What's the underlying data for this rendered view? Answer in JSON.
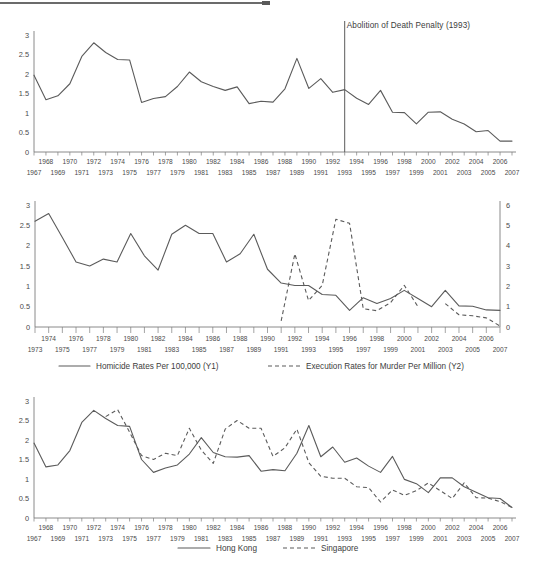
{
  "page": {
    "top_rule": "horizontal-rule",
    "background_color": "#ffffff",
    "line_color": "#5b5b5b",
    "text_color": "#3f3f3f"
  },
  "chart_data": [
    {
      "id": "chart1",
      "type": "line",
      "title": "",
      "xlabel": "",
      "ylabel": "",
      "ylim": [
        0,
        3
      ],
      "yticks": [
        "0",
        "0.5",
        "1",
        "1.5",
        "2",
        "2.5",
        "3"
      ],
      "grid": false,
      "legend": "none",
      "annotations": [
        {
          "text": "Abolition of Death Penalty (1993)",
          "x_year": 1993,
          "type": "vertical-line-label"
        }
      ],
      "categories": [
        1967,
        1968,
        1969,
        1970,
        1971,
        1972,
        1973,
        1974,
        1975,
        1976,
        1977,
        1978,
        1979,
        1980,
        1981,
        1982,
        1983,
        1984,
        1985,
        1986,
        1987,
        1988,
        1989,
        1990,
        1991,
        1992,
        1993,
        1994,
        1995,
        1996,
        1997,
        1998,
        1999,
        2000,
        2001,
        2002,
        2003,
        2004,
        2005,
        2006,
        2007
      ],
      "series": [
        {
          "name": "Homicide Rates Per 100,000 (Hong Kong)",
          "style": "solid",
          "values": [
            1.97,
            1.34,
            1.44,
            1.75,
            2.45,
            2.8,
            2.55,
            2.37,
            2.36,
            1.27,
            1.37,
            1.42,
            1.68,
            2.05,
            1.8,
            1.68,
            1.58,
            1.67,
            1.24,
            1.3,
            1.28,
            1.62,
            2.4,
            1.63,
            1.88,
            1.53,
            1.6,
            1.38,
            1.22,
            1.58,
            1.02,
            1.01,
            0.72,
            1.02,
            1.03,
            0.84,
            0.72,
            0.52,
            0.55,
            0.28,
            0.28
          ]
        }
      ]
    },
    {
      "id": "chart2",
      "type": "line",
      "title": "",
      "xlabel": "",
      "ylabel": "",
      "ylim": [
        0,
        3
      ],
      "yticks": [
        "0",
        "0.5",
        "1",
        "1.5",
        "2",
        "2.5",
        "3"
      ],
      "y2lim": [
        0,
        6
      ],
      "y2ticks": [
        "0",
        "1",
        "2",
        "3",
        "4",
        "5",
        "6"
      ],
      "grid": false,
      "legend": "bottom",
      "categories": [
        1973,
        1974,
        1975,
        1976,
        1977,
        1978,
        1979,
        1980,
        1981,
        1982,
        1983,
        1984,
        1985,
        1986,
        1987,
        1988,
        1989,
        1990,
        1991,
        1992,
        1993,
        1994,
        1995,
        1996,
        1997,
        1998,
        1999,
        2000,
        2001,
        2002,
        2003,
        2004,
        2005,
        2006,
        2007
      ],
      "series": [
        {
          "name": "Homicide Rates Per 100,000 (Y1)",
          "label": "Homicide Rates Per 100,000 (Y1)",
          "style": "solid",
          "axis": "Y1",
          "values": [
            2.6,
            2.79,
            2.2,
            1.6,
            1.5,
            1.67,
            1.6,
            2.3,
            1.75,
            1.4,
            2.28,
            2.5,
            2.3,
            2.3,
            1.6,
            1.8,
            2.28,
            1.42,
            1.08,
            1.02,
            1.02,
            0.8,
            0.78,
            0.41,
            0.72,
            0.58,
            0.7,
            0.9,
            0.7,
            0.5,
            0.9,
            0.52,
            0.51,
            0.42,
            0.41
          ]
        },
        {
          "name": "Execution Rates for Murder Per Million (Y2)",
          "label": "Execution Rates for Murder Per Million (Y2)",
          "style": "dashed",
          "axis": "Y2",
          "values": [
            null,
            null,
            null,
            null,
            null,
            null,
            null,
            null,
            null,
            null,
            null,
            null,
            null,
            null,
            null,
            null,
            null,
            null,
            0.3,
            3.6,
            1.3,
            2.05,
            5.3,
            5.1,
            0.9,
            0.8,
            1.2,
            2.05,
            1.0,
            null,
            1.15,
            0.6,
            0.55,
            0.45,
            0.05
          ]
        }
      ]
    },
    {
      "id": "chart3",
      "type": "line",
      "title": "",
      "xlabel": "",
      "ylabel": "",
      "ylim": [
        0,
        3
      ],
      "yticks": [
        "0",
        "0.5",
        "1",
        "1.5",
        "2",
        "2.5",
        "3"
      ],
      "grid": false,
      "legend": "bottom",
      "categories": [
        1967,
        1968,
        1969,
        1970,
        1971,
        1972,
        1973,
        1974,
        1975,
        1976,
        1977,
        1978,
        1979,
        1980,
        1981,
        1982,
        1983,
        1984,
        1985,
        1986,
        1987,
        1988,
        1989,
        1990,
        1991,
        1992,
        1993,
        1994,
        1995,
        1996,
        1997,
        1998,
        1999,
        2000,
        2001,
        2002,
        2003,
        2004,
        2005,
        2006,
        2007
      ],
      "series": [
        {
          "name": "Hong Kong",
          "label": "Hong Kong",
          "style": "solid",
          "values": [
            1.92,
            1.31,
            1.36,
            1.73,
            2.45,
            2.76,
            2.55,
            2.37,
            2.35,
            1.5,
            1.17,
            1.28,
            1.36,
            1.64,
            2.06,
            1.68,
            1.57,
            1.56,
            1.6,
            1.2,
            1.24,
            1.21,
            1.66,
            2.37,
            1.57,
            1.82,
            1.43,
            1.54,
            1.33,
            1.17,
            1.58,
            0.99,
            0.88,
            0.65,
            1.03,
            1.03,
            0.8,
            0.66,
            0.52,
            0.5,
            0.27
          ]
        },
        {
          "name": "Singapore",
          "label": "Singapore",
          "style": "dashed",
          "values": [
            null,
            null,
            null,
            null,
            null,
            null,
            2.6,
            2.78,
            2.2,
            1.6,
            1.5,
            1.66,
            1.6,
            2.3,
            1.74,
            1.4,
            2.28,
            2.5,
            2.3,
            2.3,
            1.58,
            1.8,
            2.28,
            1.42,
            1.07,
            1.02,
            1.02,
            0.8,
            0.78,
            0.41,
            0.72,
            0.58,
            0.7,
            0.9,
            0.7,
            0.5,
            0.9,
            0.52,
            0.51,
            0.42,
            0.27
          ]
        }
      ]
    }
  ],
  "chart1": {
    "yticks": [
      "3",
      "2.5",
      "2",
      "1.5",
      "1",
      "0.5",
      "0"
    ],
    "years_top": [
      "1968",
      "1970",
      "1972",
      "1974",
      "1976",
      "1978",
      "1980",
      "1982",
      "1984",
      "1986",
      "1988",
      "1990",
      "1992",
      "1994",
      "1996",
      "1998",
      "2000",
      "2002",
      "2004",
      "2006"
    ],
    "years_bottom": [
      "1967",
      "1969",
      "1971",
      "1973",
      "1975",
      "1977",
      "1979",
      "1981",
      "1983",
      "1985",
      "1987",
      "1989",
      "1991",
      "1993",
      "1995",
      "1997",
      "1999",
      "2001",
      "2003",
      "2005",
      "2007"
    ],
    "annotation": "Abolition of Death Penalty (1993)"
  },
  "chart2": {
    "yticks": [
      "3",
      "2.5",
      "2",
      "1.5",
      "1",
      "0.5",
      "0"
    ],
    "y2ticks": [
      "6",
      "5",
      "4",
      "3",
      "2",
      "1",
      "0"
    ],
    "years_top": [
      "1974",
      "1976",
      "1978",
      "1980",
      "1982",
      "1984",
      "1986",
      "1988",
      "1990",
      "1992",
      "1994",
      "1996",
      "1998",
      "2000",
      "2002",
      "2004",
      "2006"
    ],
    "years_bottom": [
      "1973",
      "1975",
      "1977",
      "1979",
      "1981",
      "1983",
      "1985",
      "1987",
      "1989",
      "1991",
      "1993",
      "1995",
      "1997",
      "1999",
      "2001",
      "2003",
      "2005",
      "2007"
    ],
    "legend": {
      "solid_label": "Homicide Rates Per 100,000 (Y1)",
      "dashed_label": "Execution Rates for Murder Per Million (Y2)"
    }
  },
  "chart3": {
    "yticks": [
      "3",
      "2.5",
      "2",
      "1.5",
      "1",
      "0.5",
      "0"
    ],
    "years_top": [
      "1968",
      "1970",
      "1972",
      "1974",
      "1976",
      "1978",
      "1980",
      "1982",
      "1984",
      "1986",
      "1988",
      "1990",
      "1992",
      "1994",
      "1996",
      "1998",
      "2000",
      "2002",
      "2004",
      "2006"
    ],
    "years_bottom": [
      "1967",
      "1969",
      "1971",
      "1973",
      "1975",
      "1977",
      "1979",
      "1981",
      "1983",
      "1985",
      "1987",
      "1989",
      "1991",
      "1993",
      "1995",
      "1997",
      "1999",
      "2001",
      "2003",
      "2005",
      "2007"
    ],
    "legend": {
      "solid_label": "Hong Kong",
      "dashed_label": "Singapore"
    }
  }
}
